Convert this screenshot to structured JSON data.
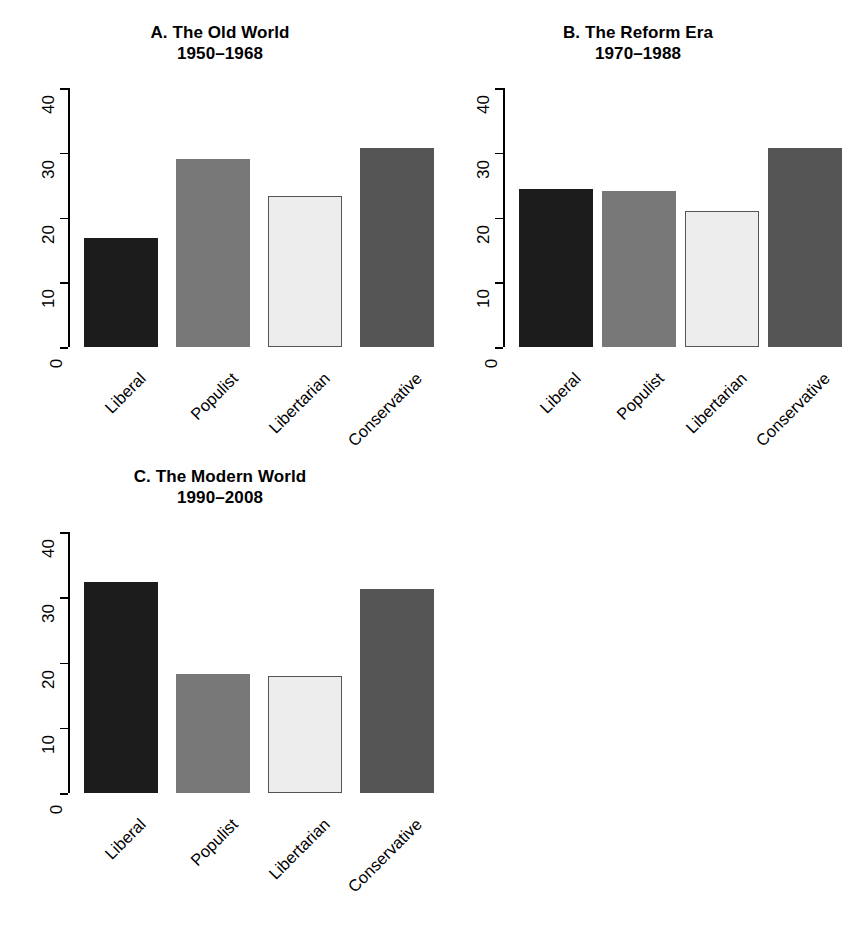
{
  "figure": {
    "background": "#ffffff",
    "categories": [
      "Liberal",
      "Populist",
      "Libertarian",
      "Conservative"
    ],
    "bar_colors": [
      "#1c1c1c",
      "#787878",
      "#ededed",
      "#555555"
    ],
    "y_ticks": [
      "0",
      "10",
      "20",
      "30",
      "40"
    ]
  },
  "panels": [
    {
      "id": "A",
      "title_line1": "A. The Old World",
      "title_line2": "1950–1968",
      "values": [
        16.9,
        29.0,
        23.4,
        30.8
      ]
    },
    {
      "id": "B",
      "title_line1": "B. The Reform Era",
      "title_line2": "1970–1988",
      "values": [
        24.4,
        24.1,
        21.0,
        30.7
      ]
    },
    {
      "id": "C",
      "title_line1": "C. The Modern World",
      "title_line2": "1990–2008",
      "values": [
        32.3,
        18.3,
        18.0,
        31.3
      ]
    }
  ],
  "chart_data": {
    "type": "bar",
    "xlabel": "",
    "ylabel": "",
    "ylim": [
      0,
      40
    ],
    "yticks": [
      0,
      10,
      20,
      30,
      40
    ],
    "grid": false,
    "legend": "none",
    "categories": [
      "Liberal",
      "Populist",
      "Libertarian",
      "Conservative"
    ],
    "panels": [
      {
        "panel": "A",
        "title": "A. The Old World",
        "subtitle": "1950–1968",
        "values": [
          16.9,
          29.0,
          23.4,
          30.8
        ]
      },
      {
        "panel": "B",
        "title": "B. The Reform Era",
        "subtitle": "1970–1988",
        "values": [
          24.4,
          24.1,
          21.0,
          30.7
        ]
      },
      {
        "panel": "C",
        "title": "C. The Modern World",
        "subtitle": "1990–2008",
        "values": [
          32.3,
          18.3,
          18.0,
          31.3
        ]
      }
    ],
    "series": [
      {
        "name": "A. The Old World (1950–1968)",
        "values": [
          16.9,
          29.0,
          23.4,
          30.8
        ]
      },
      {
        "name": "B. The Reform Era (1970–1988)",
        "values": [
          24.4,
          24.1,
          21.0,
          30.7
        ]
      },
      {
        "name": "C. The Modern World (1990–2008)",
        "values": [
          32.3,
          18.0,
          18.0,
          31.3
        ]
      }
    ]
  }
}
